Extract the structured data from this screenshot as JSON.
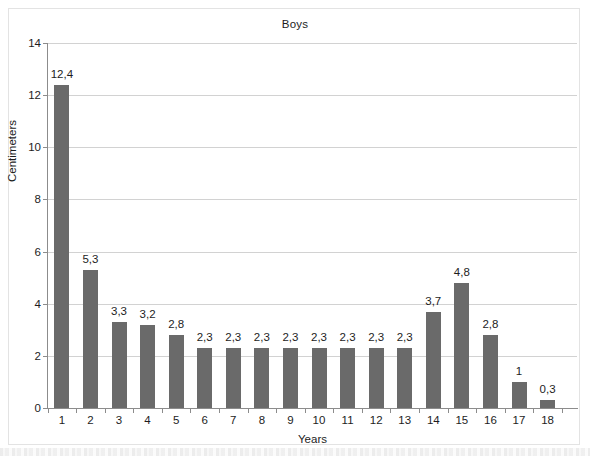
{
  "chart_data": {
    "type": "bar",
    "title": "Boys",
    "xlabel": "Years",
    "ylabel": "Centimeters",
    "categories": [
      "1",
      "2",
      "3",
      "4",
      "5",
      "6",
      "7",
      "8",
      "9",
      "10",
      "11",
      "12",
      "13",
      "14",
      "15",
      "16",
      "17",
      "18"
    ],
    "values": [
      12.4,
      5.3,
      3.3,
      3.2,
      2.8,
      2.3,
      2.3,
      2.3,
      2.3,
      2.3,
      2.3,
      2.3,
      2.3,
      3.7,
      4.8,
      2.8,
      1,
      0.3
    ],
    "data_labels": [
      "12,4",
      "5,3",
      "3,3",
      "3,2",
      "2,8",
      "2,3",
      "2,3",
      "2,3",
      "2,3",
      "2,3",
      "2,3",
      "2,3",
      "2,3",
      "3,7",
      "4,8",
      "2,8",
      "1",
      "0,3"
    ],
    "ylim": [
      0,
      14
    ],
    "ytick_values": [
      0,
      2,
      4,
      6,
      8,
      10,
      12,
      14
    ],
    "ytick_labels": [
      "0",
      "2",
      "4",
      "6",
      "8",
      "10",
      "12",
      "14"
    ],
    "grid": true,
    "legend": "none",
    "bar_color": "#6a6a6a",
    "grid_color": "#d2d2d2",
    "axis_color": "#8c8c8c",
    "text_color": "#1d1d1d",
    "decimal_separator": ","
  }
}
